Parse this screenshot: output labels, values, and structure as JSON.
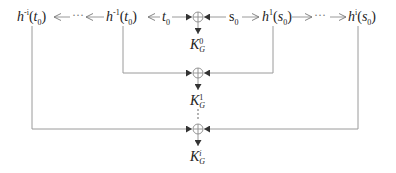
{
  "diagram": {
    "top_row": {
      "left_far": {
        "base": "h",
        "exp": "-i",
        "arg": "t",
        "arg_sub": "0"
      },
      "left_near": {
        "base": "h",
        "exp": "-1",
        "arg": "t",
        "arg_sub": "0"
      },
      "t0": {
        "base": "t",
        "sub": "0"
      },
      "s0": {
        "base": "s",
        "sub": "0"
      },
      "right_near": {
        "base": "h",
        "exp": "1",
        "arg": "s",
        "arg_sub": "0"
      },
      "right_far": {
        "base": "h",
        "exp": "i",
        "arg": "s",
        "arg_sub": "0"
      },
      "ellipsis_left": "···",
      "ellipsis_right": "···"
    },
    "outputs": [
      {
        "base": "K",
        "sup": "0",
        "sub": "G"
      },
      {
        "base": "K",
        "sup": "1",
        "sub": "G"
      },
      {
        "base": "K",
        "sup": "i",
        "sub": "G"
      }
    ],
    "vertical_ellipsis": "⋮",
    "xor_symbol": "⊕",
    "colors": {
      "line": "#9a9a9a",
      "arrowhead": "#333333",
      "text": "#222222"
    }
  }
}
